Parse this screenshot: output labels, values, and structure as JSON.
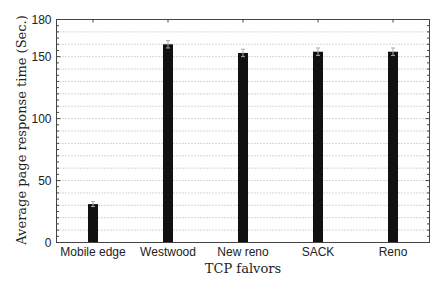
{
  "chart_data": {
    "type": "bar",
    "title": "",
    "xlabel": "TCP falvors",
    "ylabel": "Average page response time (Sec.)",
    "categories": [
      "Mobile edge",
      "Westwood",
      "New reno",
      "SACK",
      "Reno"
    ],
    "values": [
      31,
      160,
      153,
      154,
      154
    ],
    "error": [
      2,
      3,
      3,
      3,
      3
    ],
    "ylim": [
      0,
      180
    ],
    "yticks": [
      0,
      50,
      100,
      150,
      180
    ],
    "grid": true,
    "grid_style": "dotted, every 10",
    "legend": null,
    "bar_color": "#111111"
  }
}
